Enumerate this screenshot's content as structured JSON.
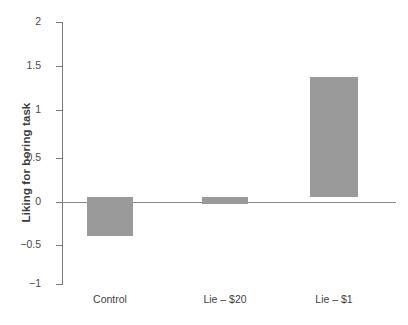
{
  "chart_data": {
    "type": "bar",
    "title": "",
    "subtitle": "",
    "xlabel": "",
    "ylabel": "Liking for boring task",
    "categories": [
      "Control",
      "Lie – $20",
      "Lie – $1"
    ],
    "values": [
      -0.45,
      -0.08,
      1.37
    ],
    "series": [
      {
        "name": "Liking for boring task",
        "values": [
          -0.45,
          -0.08,
          1.37
        ]
      }
    ],
    "ylim": [
      -1,
      2
    ],
    "yticks": [
      2,
      1.5,
      1,
      0.5,
      0,
      -0.5,
      -1
    ],
    "ytick_labels": [
      "2",
      "1.5",
      "1",
      "0.5",
      "0",
      "−0.5",
      "−1"
    ],
    "xtick_labels": [
      "Control",
      "Lie – $20",
      "Lie – $1"
    ],
    "grid": false,
    "legend": false,
    "legend_position": "none",
    "annotations": [],
    "bar_color": "#9a9a9a",
    "axis_color": "#7a7a7a",
    "zero_line_color": "#8a8a8a",
    "background_color": "#ffffff"
  },
  "axis": {
    "y_title": "Liking for boring task"
  }
}
